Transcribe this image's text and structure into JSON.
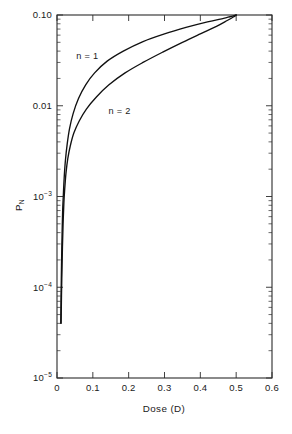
{
  "chart_data": {
    "type": "line",
    "title": "",
    "subtitle": "",
    "xlabel": "Dose (D)",
    "ylabel": "P",
    "ylabel_sub": "N",
    "yscale": "log",
    "xscale": "linear",
    "xlim": [
      0,
      0.6
    ],
    "ylim": [
      1e-05,
      0.1
    ],
    "grid": false,
    "legend_position": "inline-annotations",
    "xticks": [
      0,
      0.1,
      0.2,
      0.3,
      0.4,
      0.5,
      0.6
    ],
    "xticklabels": [
      "0",
      "0.1",
      "0.2",
      "0.3",
      "0.4",
      "0.5",
      "0.6"
    ],
    "yticks": [
      0.1,
      0.01,
      0.001,
      0.0001,
      1e-05
    ],
    "yticklabels": [
      "0.10",
      "0.01",
      "10⁻³",
      "10⁻⁴",
      "10⁻⁵"
    ],
    "ytick_parts": [
      {
        "base": "0.10",
        "exp": ""
      },
      {
        "base": "0.01",
        "exp": ""
      },
      {
        "base": "10",
        "exp": "-3"
      },
      {
        "base": "10",
        "exp": "-4"
      },
      {
        "base": "10",
        "exp": "-5"
      }
    ],
    "annotations": [
      {
        "text": "n = 1",
        "x": 0.085,
        "y": 0.033
      },
      {
        "text": "n = 2",
        "x": 0.175,
        "y": 0.0082
      }
    ],
    "series": [
      {
        "name": "n = 1",
        "points": [
          [
            0.0105,
            4e-05
          ],
          [
            0.0112,
            7e-05
          ],
          [
            0.012,
            0.00012
          ],
          [
            0.013,
            0.00022
          ],
          [
            0.0143,
            0.0004
          ],
          [
            0.0158,
            0.0007
          ],
          [
            0.0175,
            0.001
          ],
          [
            0.02,
            0.0016
          ],
          [
            0.0235,
            0.0025
          ],
          [
            0.0285,
            0.0038
          ],
          [
            0.035,
            0.0056
          ],
          [
            0.045,
            0.0082
          ],
          [
            0.06,
            0.012
          ],
          [
            0.08,
            0.017
          ],
          [
            0.105,
            0.023
          ],
          [
            0.14,
            0.031
          ],
          [
            0.185,
            0.04
          ],
          [
            0.24,
            0.051
          ],
          [
            0.3,
            0.062
          ],
          [
            0.36,
            0.073
          ],
          [
            0.42,
            0.084
          ],
          [
            0.465,
            0.092
          ],
          [
            0.49,
            0.097
          ],
          [
            0.5,
            0.1
          ]
        ]
      },
      {
        "name": "n = 2",
        "points": [
          [
            0.0115,
            4e-05
          ],
          [
            0.0125,
            8e-05
          ],
          [
            0.0138,
            0.00015
          ],
          [
            0.0152,
            0.00028
          ],
          [
            0.017,
            0.0005
          ],
          [
            0.0192,
            0.00085
          ],
          [
            0.0215,
            0.0012
          ],
          [
            0.025,
            0.0018
          ],
          [
            0.03,
            0.0026
          ],
          [
            0.037,
            0.0036
          ],
          [
            0.047,
            0.005
          ],
          [
            0.062,
            0.0068
          ],
          [
            0.082,
            0.0092
          ],
          [
            0.11,
            0.0125
          ],
          [
            0.145,
            0.017
          ],
          [
            0.19,
            0.023
          ],
          [
            0.24,
            0.03
          ],
          [
            0.295,
            0.039
          ],
          [
            0.35,
            0.05
          ],
          [
            0.4,
            0.062
          ],
          [
            0.445,
            0.075
          ],
          [
            0.475,
            0.087
          ],
          [
            0.492,
            0.095
          ],
          [
            0.5,
            0.1
          ]
        ]
      }
    ]
  },
  "colors": {
    "curve": "#111111",
    "axis": "#2b2b2b",
    "text": "#1a1a1a",
    "background": "#ffffff"
  }
}
